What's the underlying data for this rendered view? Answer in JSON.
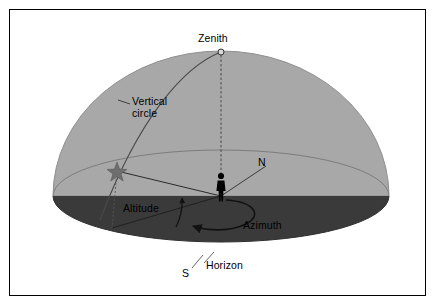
{
  "figure": {
    "width": 437,
    "height": 307,
    "background": "#ffffff",
    "border_color": "#000000"
  },
  "colors": {
    "dome": "#a8a8a8",
    "dome_edge": "#8f8f8f",
    "ground": "#3a3a3a",
    "ground_edge": "#2a2a2a",
    "line": "#1a1a1a",
    "thin_line": "#555555",
    "star": "#6e6e6e",
    "observer": "#000000",
    "label_text": "#000000",
    "page": "#ffffff"
  },
  "labels": {
    "zenith": "Zenith",
    "vertical_circle_line1": "Vertical",
    "vertical_circle_line2": "circle",
    "north": "N",
    "south": "S",
    "altitude": "Altitude",
    "azimuth": "Azimuth",
    "horizon": "Horizon"
  },
  "markers": {
    "zenith_point": "zenith-circle-marker",
    "star_point": "star-marker",
    "observer": "observer-silhouette",
    "azimuth_arrow": "azimuth-curved-arrow",
    "altitude_arrow": "altitude-angle-arrow"
  },
  "geometry": {
    "dome_center_x": 221,
    "dome_apex_y": 52,
    "horizon_center_y": 196,
    "horizon_rx": 168,
    "horizon_ry": 46,
    "dome_ry": 145,
    "zenith_marker_radius": 3,
    "star_x": 117,
    "star_y": 171,
    "observer_x": 221,
    "observer_y": 196,
    "north_point_x": 268,
    "north_point_y": 168,
    "south_point_x": 190,
    "south_point_y": 253
  }
}
